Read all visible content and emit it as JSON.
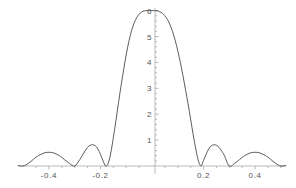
{
  "figure": {
    "title": "",
    "background_color": "#ffffff",
    "curve_color": "#4a4a4a",
    "axis_color": "#a8a8a8",
    "label_color": "#555555"
  },
  "chart_data": {
    "type": "line",
    "title": "",
    "xlabel": "",
    "ylabel": "",
    "xlim": [
      -0.52,
      0.52
    ],
    "ylim": [
      -0.45,
      6.2
    ],
    "grid": false,
    "legend": null,
    "x_ticks": [
      -0.4,
      -0.2,
      0.2,
      0.4
    ],
    "x_tick_labels": [
      "-0.4",
      "-0.2",
      "0.2",
      "0.4"
    ],
    "y_ticks": [
      1,
      2,
      3,
      4,
      5,
      6
    ],
    "y_tick_labels": [
      "1",
      "2",
      "3",
      "4",
      "5",
      "6"
    ],
    "y_minor_ticks": [
      0.2,
      0.4,
      0.6,
      0.8,
      1.2,
      1.4,
      1.6,
      1.8,
      2.2,
      2.4,
      2.6,
      2.8,
      3.2,
      3.4,
      3.6,
      3.8,
      4.2,
      4.4,
      4.6,
      4.8,
      5.2,
      5.4,
      5.6,
      5.8
    ],
    "x_minor_ticks": [
      -0.45,
      -0.35,
      -0.3,
      -0.25,
      -0.15,
      -0.1,
      -0.05,
      0.05,
      0.1,
      0.15,
      0.25,
      0.3,
      0.35,
      0.45,
      0.5
    ],
    "series": [
      {
        "name": "dirichlet-kernel",
        "description": "Dirichlet kernel sin(11 pi x)/sin(pi x) scaled, peak 6 at x=0",
        "peak_value": 6,
        "peak_x": 0,
        "x": [
          -0.52,
          -0.5,
          -0.48,
          -0.46,
          -0.45,
          -0.44,
          -0.42,
          -0.4,
          -0.38,
          -0.36,
          -0.35,
          -0.34,
          -0.32,
          -0.3,
          -0.28,
          -0.27,
          -0.26,
          -0.25,
          -0.24,
          -0.23,
          -0.22,
          -0.21,
          -0.2,
          -0.19,
          -0.18,
          -0.17,
          -0.16,
          -0.15,
          -0.14,
          -0.13,
          -0.12,
          -0.11,
          -0.1,
          -0.09,
          -0.08,
          -0.07,
          -0.06,
          -0.05,
          -0.04,
          -0.03,
          -0.02,
          -0.01,
          0,
          0.01,
          0.02,
          0.03,
          0.04,
          0.05,
          0.06,
          0.07,
          0.08,
          0.09,
          0.1,
          0.11,
          0.12,
          0.13,
          0.14,
          0.15,
          0.16,
          0.17,
          0.18,
          0.19,
          0.2,
          0.21,
          0.22,
          0.23,
          0.24,
          0.25,
          0.26,
          0.27,
          0.28,
          0.3,
          0.32,
          0.34,
          0.35,
          0.36,
          0.38,
          0.4,
          0.42,
          0.44,
          0.45,
          0.46,
          0.48,
          0.5,
          0.52
        ],
        "y": [
          0.02,
          0.0,
          0.1,
          0.26,
          0.34,
          0.4,
          0.5,
          0.53,
          0.5,
          0.4,
          0.33,
          0.25,
          0.1,
          0.0,
          0.25,
          0.42,
          0.58,
          0.72,
          0.8,
          0.82,
          0.78,
          0.66,
          0.45,
          0.2,
          0.0,
          0.1,
          0.5,
          1.1,
          1.75,
          2.45,
          3.1,
          3.72,
          4.3,
          4.8,
          5.2,
          5.5,
          5.72,
          5.86,
          5.95,
          5.99,
          6.0,
          6.0,
          6.0,
          6.0,
          5.99,
          5.96,
          5.9,
          5.8,
          5.66,
          5.45,
          5.18,
          4.85,
          4.45,
          4.0,
          3.5,
          2.95,
          2.4,
          1.8,
          1.2,
          0.65,
          0.2,
          0.0,
          0.22,
          0.45,
          0.66,
          0.78,
          0.82,
          0.8,
          0.72,
          0.58,
          0.42,
          0.0,
          0.1,
          0.25,
          0.33,
          0.4,
          0.5,
          0.53,
          0.5,
          0.4,
          0.34,
          0.26,
          0.1,
          0.0,
          0.02
        ]
      }
    ]
  },
  "axes": {
    "x_axis_name": "horizontal-axis",
    "y_axis_name": "vertical-axis"
  }
}
